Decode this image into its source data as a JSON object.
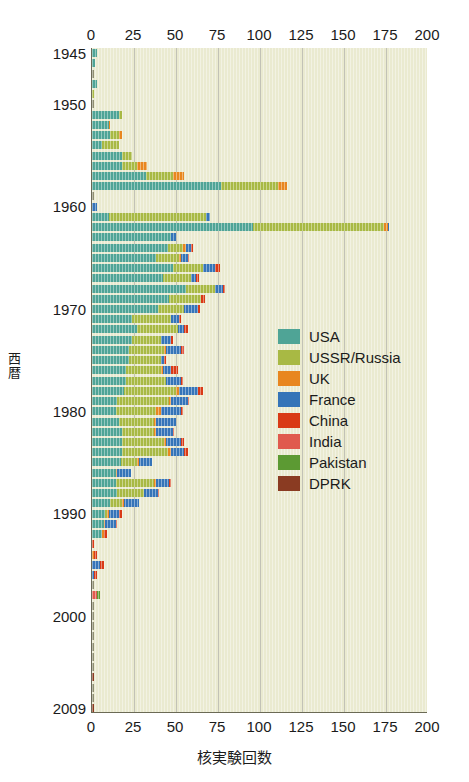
{
  "chart_data": {
    "type": "bar",
    "orientation": "horizontal-stacked",
    "title": "",
    "xlabel": "核実験回数",
    "ylabel": "西暦",
    "xlim": [
      0,
      200
    ],
    "ylim_years": [
      1945,
      2009
    ],
    "grid": true,
    "legend_position": "inside-right",
    "xticks": [
      0,
      25,
      50,
      75,
      100,
      125,
      150,
      175,
      200
    ],
    "xticks_top": [
      "0",
      "25",
      "50",
      "75",
      "100",
      "125",
      "150",
      "175",
      "200"
    ],
    "xticks_bottom": [
      "0",
      "25",
      "50",
      "75",
      "100",
      "125",
      "150",
      "175",
      "200"
    ],
    "yticks": [
      "1945",
      "1950",
      "1960",
      "1970",
      "1980",
      "1990",
      "2000",
      "2009"
    ],
    "ytick_years": [
      1945,
      1950,
      1960,
      1970,
      1980,
      1990,
      2000,
      2009
    ],
    "series": [
      {
        "name": "USA",
        "color": "#4fa496"
      },
      {
        "name": "USSR/Russia",
        "color": "#a8b944"
      },
      {
        "name": "UK",
        "color": "#e8861f"
      },
      {
        "name": "France",
        "color": "#3574b8"
      },
      {
        "name": "China",
        "color": "#d93a16"
      },
      {
        "name": "India",
        "color": "#e05a4e"
      },
      {
        "name": "Pakistan",
        "color": "#5c9a33"
      },
      {
        "name": "DPRK",
        "color": "#8a3b22"
      }
    ],
    "categories": [
      1945,
      1946,
      1947,
      1948,
      1949,
      1950,
      1951,
      1952,
      1953,
      1954,
      1955,
      1956,
      1957,
      1958,
      1959,
      1960,
      1961,
      1962,
      1963,
      1964,
      1965,
      1966,
      1967,
      1968,
      1969,
      1970,
      1971,
      1972,
      1973,
      1974,
      1975,
      1976,
      1977,
      1978,
      1979,
      1980,
      1981,
      1982,
      1983,
      1984,
      1985,
      1986,
      1987,
      1988,
      1989,
      1990,
      1991,
      1992,
      1993,
      1994,
      1995,
      1996,
      1997,
      1998,
      1999,
      2000,
      2001,
      2002,
      2003,
      2004,
      2005,
      2006,
      2007,
      2008,
      2009
    ],
    "rows": [
      {
        "year": 1945,
        "USA": 3,
        "USSR": 0,
        "UK": 0,
        "France": 0,
        "China": 0,
        "India": 0,
        "Pakistan": 0,
        "DPRK": 0
      },
      {
        "year": 1946,
        "USA": 2,
        "USSR": 0,
        "UK": 0,
        "France": 0,
        "China": 0,
        "India": 0,
        "Pakistan": 0,
        "DPRK": 0
      },
      {
        "year": 1947,
        "USA": 0,
        "USSR": 0,
        "UK": 0,
        "France": 0,
        "China": 0,
        "India": 0,
        "Pakistan": 0,
        "DPRK": 0
      },
      {
        "year": 1948,
        "USA": 3,
        "USSR": 0,
        "UK": 0,
        "France": 0,
        "China": 0,
        "India": 0,
        "Pakistan": 0,
        "DPRK": 0
      },
      {
        "year": 1949,
        "USA": 0,
        "USSR": 1,
        "UK": 0,
        "France": 0,
        "China": 0,
        "India": 0,
        "Pakistan": 0,
        "DPRK": 0
      },
      {
        "year": 1950,
        "USA": 0,
        "USSR": 0,
        "UK": 0,
        "France": 0,
        "China": 0,
        "India": 0,
        "Pakistan": 0,
        "DPRK": 0
      },
      {
        "year": 1951,
        "USA": 16,
        "USSR": 2,
        "UK": 0,
        "France": 0,
        "China": 0,
        "India": 0,
        "Pakistan": 0,
        "DPRK": 0
      },
      {
        "year": 1952,
        "USA": 10,
        "USSR": 0,
        "UK": 1,
        "France": 0,
        "China": 0,
        "India": 0,
        "Pakistan": 0,
        "DPRK": 0
      },
      {
        "year": 1953,
        "USA": 11,
        "USSR": 5,
        "UK": 2,
        "France": 0,
        "China": 0,
        "India": 0,
        "Pakistan": 0,
        "DPRK": 0
      },
      {
        "year": 1954,
        "USA": 6,
        "USSR": 10,
        "UK": 0,
        "France": 0,
        "China": 0,
        "India": 0,
        "Pakistan": 0,
        "DPRK": 0
      },
      {
        "year": 1955,
        "USA": 18,
        "USSR": 6,
        "UK": 0,
        "France": 0,
        "China": 0,
        "India": 0,
        "Pakistan": 0,
        "DPRK": 0
      },
      {
        "year": 1956,
        "USA": 18,
        "USSR": 9,
        "UK": 6,
        "France": 0,
        "China": 0,
        "India": 0,
        "Pakistan": 0,
        "DPRK": 0
      },
      {
        "year": 1957,
        "USA": 32,
        "USSR": 16,
        "UK": 7,
        "France": 0,
        "China": 0,
        "India": 0,
        "Pakistan": 0,
        "DPRK": 0
      },
      {
        "year": 1958,
        "USA": 77,
        "USSR": 34,
        "UK": 5,
        "France": 0,
        "China": 0,
        "India": 0,
        "Pakistan": 0,
        "DPRK": 0
      },
      {
        "year": 1959,
        "USA": 0,
        "USSR": 0,
        "UK": 0,
        "France": 0,
        "China": 0,
        "India": 0,
        "Pakistan": 0,
        "DPRK": 0
      },
      {
        "year": 1960,
        "USA": 0,
        "USSR": 0,
        "UK": 0,
        "France": 3,
        "China": 0,
        "India": 0,
        "Pakistan": 0,
        "DPRK": 0
      },
      {
        "year": 1961,
        "USA": 10,
        "USSR": 58,
        "UK": 0,
        "France": 2,
        "China": 0,
        "India": 0,
        "Pakistan": 0,
        "DPRK": 0
      },
      {
        "year": 1962,
        "USA": 96,
        "USSR": 78,
        "UK": 2,
        "France": 1,
        "China": 0,
        "India": 0,
        "Pakistan": 0,
        "DPRK": 0
      },
      {
        "year": 1963,
        "USA": 47,
        "USSR": 0,
        "UK": 0,
        "France": 3,
        "China": 0,
        "India": 0,
        "Pakistan": 0,
        "DPRK": 0
      },
      {
        "year": 1964,
        "USA": 45,
        "USSR": 9,
        "UK": 2,
        "France": 3,
        "China": 1,
        "India": 0,
        "Pakistan": 0,
        "DPRK": 0
      },
      {
        "year": 1965,
        "USA": 38,
        "USSR": 14,
        "UK": 1,
        "France": 4,
        "China": 1,
        "India": 0,
        "Pakistan": 0,
        "DPRK": 0
      },
      {
        "year": 1966,
        "USA": 48,
        "USSR": 18,
        "UK": 0,
        "France": 7,
        "China": 3,
        "India": 0,
        "Pakistan": 0,
        "DPRK": 0
      },
      {
        "year": 1967,
        "USA": 42,
        "USSR": 17,
        "UK": 0,
        "France": 3,
        "China": 2,
        "India": 0,
        "Pakistan": 0,
        "DPRK": 0
      },
      {
        "year": 1968,
        "USA": 56,
        "USSR": 17,
        "UK": 0,
        "France": 5,
        "China": 1,
        "India": 0,
        "Pakistan": 0,
        "DPRK": 0
      },
      {
        "year": 1969,
        "USA": 46,
        "USSR": 19,
        "UK": 0,
        "France": 0,
        "China": 2,
        "India": 0,
        "Pakistan": 0,
        "DPRK": 0
      },
      {
        "year": 1970,
        "USA": 39,
        "USSR": 16,
        "UK": 0,
        "France": 8,
        "China": 1,
        "India": 0,
        "Pakistan": 0,
        "DPRK": 0
      },
      {
        "year": 1971,
        "USA": 24,
        "USSR": 23,
        "UK": 0,
        "France": 5,
        "China": 1,
        "India": 0,
        "Pakistan": 0,
        "DPRK": 0
      },
      {
        "year": 1972,
        "USA": 27,
        "USSR": 24,
        "UK": 0,
        "France": 4,
        "China": 2,
        "India": 0,
        "Pakistan": 0,
        "DPRK": 0
      },
      {
        "year": 1973,
        "USA": 24,
        "USSR": 17,
        "UK": 0,
        "France": 6,
        "China": 1,
        "India": 0,
        "Pakistan": 0,
        "DPRK": 0
      },
      {
        "year": 1974,
        "USA": 22,
        "USSR": 21,
        "UK": 1,
        "France": 9,
        "China": 1,
        "India": 1,
        "Pakistan": 0,
        "DPRK": 0
      },
      {
        "year": 1975,
        "USA": 22,
        "USSR": 19,
        "UK": 0,
        "France": 2,
        "China": 1,
        "India": 0,
        "Pakistan": 0,
        "DPRK": 0
      },
      {
        "year": 1976,
        "USA": 20,
        "USSR": 21,
        "UK": 1,
        "France": 5,
        "China": 4,
        "India": 0,
        "Pakistan": 0,
        "DPRK": 0
      },
      {
        "year": 1977,
        "USA": 20,
        "USSR": 24,
        "UK": 0,
        "France": 9,
        "China": 1,
        "India": 0,
        "Pakistan": 0,
        "DPRK": 0
      },
      {
        "year": 1978,
        "USA": 19,
        "USSR": 31,
        "UK": 2,
        "France": 11,
        "China": 3,
        "India": 0,
        "Pakistan": 0,
        "DPRK": 0
      },
      {
        "year": 1979,
        "USA": 15,
        "USSR": 31,
        "UK": 1,
        "France": 10,
        "China": 1,
        "India": 0,
        "Pakistan": 0,
        "DPRK": 0
      },
      {
        "year": 1980,
        "USA": 14,
        "USSR": 24,
        "UK": 3,
        "France": 12,
        "China": 1,
        "India": 0,
        "Pakistan": 0,
        "DPRK": 0
      },
      {
        "year": 1981,
        "USA": 16,
        "USSR": 21,
        "UK": 1,
        "France": 12,
        "China": 0,
        "India": 0,
        "Pakistan": 0,
        "DPRK": 0
      },
      {
        "year": 1982,
        "USA": 18,
        "USSR": 19,
        "UK": 1,
        "France": 10,
        "China": 1,
        "India": 0,
        "Pakistan": 0,
        "DPRK": 0
      },
      {
        "year": 1983,
        "USA": 18,
        "USSR": 25,
        "UK": 1,
        "France": 9,
        "China": 2,
        "India": 0,
        "Pakistan": 0,
        "DPRK": 0
      },
      {
        "year": 1984,
        "USA": 18,
        "USSR": 27,
        "UK": 2,
        "France": 8,
        "China": 2,
        "India": 0,
        "Pakistan": 0,
        "DPRK": 0
      },
      {
        "year": 1985,
        "USA": 17,
        "USSR": 10,
        "UK": 1,
        "France": 8,
        "China": 0,
        "India": 0,
        "Pakistan": 0,
        "DPRK": 0
      },
      {
        "year": 1986,
        "USA": 14,
        "USSR": 0,
        "UK": 1,
        "France": 8,
        "China": 0,
        "India": 0,
        "Pakistan": 0,
        "DPRK": 0
      },
      {
        "year": 1987,
        "USA": 14,
        "USSR": 23,
        "UK": 1,
        "France": 8,
        "China": 1,
        "India": 0,
        "Pakistan": 0,
        "DPRK": 0
      },
      {
        "year": 1988,
        "USA": 15,
        "USSR": 16,
        "UK": 0,
        "France": 8,
        "China": 1,
        "India": 0,
        "Pakistan": 0,
        "DPRK": 0
      },
      {
        "year": 1989,
        "USA": 11,
        "USSR": 7,
        "UK": 1,
        "France": 9,
        "China": 0,
        "India": 0,
        "Pakistan": 0,
        "DPRK": 0
      },
      {
        "year": 1990,
        "USA": 8,
        "USSR": 1,
        "UK": 1,
        "France": 6,
        "China": 2,
        "India": 0,
        "Pakistan": 0,
        "DPRK": 0
      },
      {
        "year": 1991,
        "USA": 7,
        "USSR": 0,
        "UK": 1,
        "France": 6,
        "China": 1,
        "India": 0,
        "Pakistan": 0,
        "DPRK": 0
      },
      {
        "year": 1992,
        "USA": 6,
        "USSR": 0,
        "UK": 1,
        "France": 0,
        "China": 2,
        "India": 0,
        "Pakistan": 0,
        "DPRK": 0
      },
      {
        "year": 1993,
        "USA": 0,
        "USSR": 0,
        "UK": 0,
        "France": 0,
        "China": 1,
        "India": 0,
        "Pakistan": 0,
        "DPRK": 0
      },
      {
        "year": 1994,
        "USA": 0,
        "USSR": 0,
        "UK": 1,
        "France": 0,
        "China": 2,
        "India": 0,
        "Pakistan": 0,
        "DPRK": 0
      },
      {
        "year": 1995,
        "USA": 0,
        "USSR": 0,
        "UK": 0,
        "France": 5,
        "China": 2,
        "India": 0,
        "Pakistan": 0,
        "DPRK": 0
      },
      {
        "year": 1996,
        "USA": 0,
        "USSR": 0,
        "UK": 0,
        "France": 1,
        "China": 2,
        "India": 0,
        "Pakistan": 0,
        "DPRK": 0
      },
      {
        "year": 1997,
        "USA": 0,
        "USSR": 0,
        "UK": 0,
        "France": 0,
        "China": 0,
        "India": 0,
        "Pakistan": 0,
        "DPRK": 0
      },
      {
        "year": 1998,
        "USA": 0,
        "USSR": 0,
        "UK": 0,
        "France": 0,
        "China": 0,
        "India": 3,
        "Pakistan": 2,
        "DPRK": 0
      },
      {
        "year": 1999,
        "USA": 0,
        "USSR": 0,
        "UK": 0,
        "France": 0,
        "China": 0,
        "India": 0,
        "Pakistan": 0,
        "DPRK": 0
      },
      {
        "year": 2000,
        "USA": 0,
        "USSR": 0,
        "UK": 0,
        "France": 0,
        "China": 0,
        "India": 0,
        "Pakistan": 0,
        "DPRK": 0
      },
      {
        "year": 2001,
        "USA": 0,
        "USSR": 0,
        "UK": 0,
        "France": 0,
        "China": 0,
        "India": 0,
        "Pakistan": 0,
        "DPRK": 0
      },
      {
        "year": 2002,
        "USA": 0,
        "USSR": 0,
        "UK": 0,
        "France": 0,
        "China": 0,
        "India": 0,
        "Pakistan": 0,
        "DPRK": 0
      },
      {
        "year": 2003,
        "USA": 0,
        "USSR": 0,
        "UK": 0,
        "France": 0,
        "China": 0,
        "India": 0,
        "Pakistan": 0,
        "DPRK": 0
      },
      {
        "year": 2004,
        "USA": 0,
        "USSR": 0,
        "UK": 0,
        "France": 0,
        "China": 0,
        "India": 0,
        "Pakistan": 0,
        "DPRK": 0
      },
      {
        "year": 2005,
        "USA": 0,
        "USSR": 0,
        "UK": 0,
        "France": 0,
        "China": 0,
        "India": 0,
        "Pakistan": 0,
        "DPRK": 0
      },
      {
        "year": 2006,
        "USA": 0,
        "USSR": 0,
        "UK": 0,
        "France": 0,
        "China": 0,
        "India": 0,
        "Pakistan": 0,
        "DPRK": 1
      },
      {
        "year": 2007,
        "USA": 0,
        "USSR": 0,
        "UK": 0,
        "France": 0,
        "China": 0,
        "India": 0,
        "Pakistan": 0,
        "DPRK": 0
      },
      {
        "year": 2008,
        "USA": 0,
        "USSR": 0,
        "UK": 0,
        "France": 0,
        "China": 0,
        "India": 0,
        "Pakistan": 0,
        "DPRK": 0
      },
      {
        "year": 2009,
        "USA": 0,
        "USSR": 0,
        "UK": 0,
        "France": 0,
        "China": 0,
        "India": 0,
        "Pakistan": 0,
        "DPRK": 1
      }
    ]
  },
  "legend": {
    "items": [
      {
        "label": "USA",
        "color": "#4fa496"
      },
      {
        "label": "USSR/Russia",
        "color": "#a8b944"
      },
      {
        "label": "UK",
        "color": "#e8861f"
      },
      {
        "label": "France",
        "color": "#3574b8"
      },
      {
        "label": "China",
        "color": "#d93a16"
      },
      {
        "label": "India",
        "color": "#e05a4e"
      },
      {
        "label": "Pakistan",
        "color": "#5c9a33"
      },
      {
        "label": "DPRK",
        "color": "#8a3b22"
      }
    ]
  },
  "axes": {
    "x_title": "核実験回数",
    "y_title": "西暦",
    "plot_background": "#eaead0",
    "grid_color": "#9a9a86",
    "axis_color": "#6b6a55"
  }
}
